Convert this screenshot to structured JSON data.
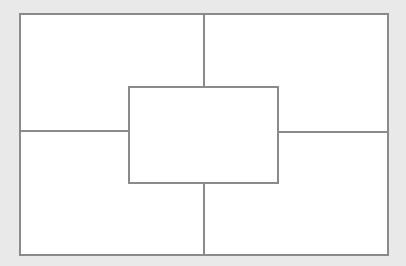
{
  "diagram": {
    "type": "graphic-organizer",
    "colors": {
      "background": "#e9e9e9",
      "cell_fill": "#ffffff",
      "line": "#8a8a8a"
    },
    "cells": {
      "top_left": "",
      "top_right": "",
      "bottom_left": "",
      "bottom_right": "",
      "center": ""
    }
  }
}
